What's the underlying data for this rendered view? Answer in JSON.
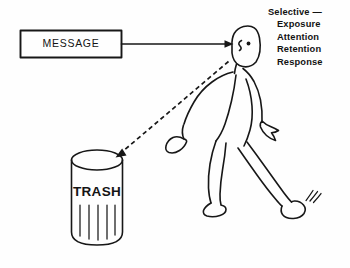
{
  "diagram": {
    "message_box": {
      "label": "MESSAGE"
    },
    "trash_can": {
      "label": "TRASH"
    },
    "selective_list": {
      "heading": "Selective —",
      "items": [
        "Exposure",
        "Attention",
        "Retention",
        "Response"
      ]
    },
    "arrows": {
      "message_to_person": "solid-arrow-right",
      "person_to_trash": "dashed-arrow-down-left"
    },
    "figure": {
      "name": "walking-person",
      "parts": [
        "head",
        "eye",
        "nose",
        "torso",
        "left-arm",
        "right-arm",
        "left-hand",
        "right-hand",
        "left-leg",
        "right-leg",
        "left-foot",
        "right-foot",
        "motion-lines"
      ]
    },
    "colors": {
      "ink": "#171717",
      "background": "#fefefe"
    }
  }
}
